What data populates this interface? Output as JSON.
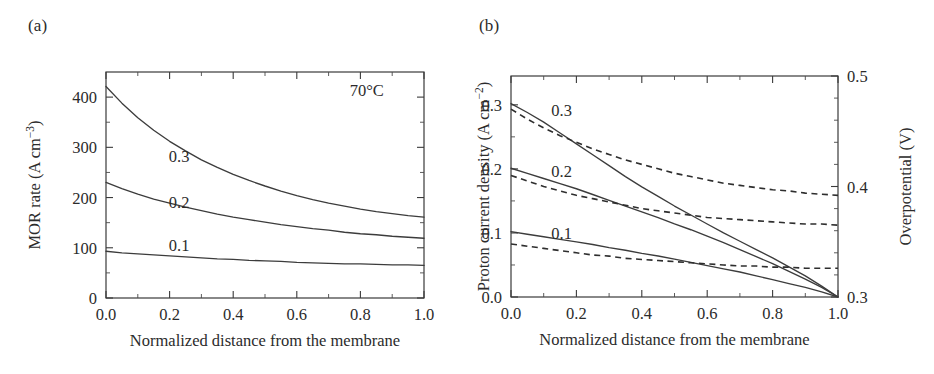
{
  "figure": {
    "panels": [
      {
        "tag": "(a)",
        "annotation": "70°C",
        "xlabel": "Normalized distance from the membrane",
        "ylabel_main": "MOR rate (A cm",
        "ylabel_sup": "−3",
        "ylabel_close": ")",
        "xticks": [
          "0.0",
          "0.2",
          "0.4",
          "0.6",
          "0.8",
          "1.0"
        ],
        "yticks": [
          "0",
          "100",
          "200",
          "300",
          "400"
        ],
        "curve_labels": [
          "0.3",
          "0.2",
          "0.1"
        ]
      },
      {
        "tag": "(b)",
        "xlabel": "Normalized distance from the membrane",
        "ylabel_main": "Proton current density (A cm",
        "ylabel_sup": "−2",
        "ylabel_close": ")",
        "ylabel_right": "Overpotential (V)",
        "xticks": [
          "0.0",
          "0.2",
          "0.4",
          "0.6",
          "0.8",
          "1.0"
        ],
        "yticks_left": [
          "0.0",
          "0.1",
          "0.2",
          "0.3"
        ],
        "yticks_right": [
          "0.3",
          "0.4",
          "0.5"
        ],
        "curve_labels": [
          "0.3",
          "0.2",
          "0.1"
        ]
      }
    ]
  },
  "chart_data": [
    {
      "type": "line",
      "panel": "(a)",
      "title": "",
      "xlabel": "Normalized distance from the membrane",
      "ylabel": "MOR rate (A cm−3)",
      "xlim": [
        0.0,
        1.0
      ],
      "ylim": [
        0,
        450
      ],
      "xticks": [
        0.0,
        0.2,
        0.4,
        0.6,
        0.8,
        1.0
      ],
      "yticks": [
        0,
        100,
        200,
        300,
        400
      ],
      "minor_ticks": true,
      "grid": false,
      "legend": "inline-curve-labels",
      "annotations": [
        {
          "text": "70°C",
          "x": 0.82,
          "y": 415
        }
      ],
      "x": [
        0.0,
        0.05,
        0.1,
        0.15,
        0.2,
        0.25,
        0.3,
        0.35,
        0.4,
        0.45,
        0.5,
        0.55,
        0.6,
        0.65,
        0.7,
        0.75,
        0.8,
        0.85,
        0.9,
        0.95,
        1.0
      ],
      "series": [
        {
          "name": "0.3",
          "style": "solid",
          "values": [
            421,
            388,
            359,
            334,
            312,
            293,
            275,
            260,
            246,
            234,
            223,
            213,
            204,
            196,
            189,
            183,
            177,
            172,
            168,
            164,
            161
          ]
        },
        {
          "name": "0.2",
          "style": "solid",
          "values": [
            230,
            218,
            207,
            197,
            189,
            181,
            174,
            167,
            161,
            156,
            151,
            146,
            142,
            138,
            135,
            131,
            128,
            126,
            123,
            121,
            119
          ]
        },
        {
          "name": "0.1",
          "style": "solid",
          "values": [
            93,
            90,
            88,
            86,
            84,
            82,
            80,
            78,
            77,
            75,
            74,
            73,
            71,
            70,
            69,
            68,
            68,
            67,
            66,
            66,
            65
          ]
        }
      ]
    },
    {
      "type": "line",
      "panel": "(b)",
      "title": "",
      "xlabel": "Normalized distance from the membrane",
      "ylabel_left": "Proton current density (A cm−2)",
      "ylabel_right": "Overpotential (V)",
      "xlim": [
        0.0,
        1.0
      ],
      "ylim_left": [
        0.0,
        0.345
      ],
      "ylim_right": [
        0.3,
        0.5
      ],
      "xticks": [
        0.0,
        0.2,
        0.4,
        0.6,
        0.8,
        1.0
      ],
      "yticks_left": [
        0.0,
        0.1,
        0.2,
        0.3
      ],
      "yticks_right": [
        0.3,
        0.4,
        0.5
      ],
      "minor_ticks": true,
      "grid": false,
      "legend": "inline-curve-labels",
      "series": [
        {
          "name": "0.3 proton current density",
          "axis": "left",
          "style": "solid",
          "x": [
            0.0,
            0.05,
            0.1,
            0.15,
            0.2,
            0.25,
            0.3,
            0.35,
            0.4,
            0.45,
            0.5,
            0.55,
            0.6,
            0.65,
            0.7,
            0.75,
            0.8,
            0.85,
            0.9,
            0.95,
            1.0
          ],
          "values": [
            0.302,
            0.288,
            0.273,
            0.256,
            0.239,
            0.222,
            0.205,
            0.188,
            0.172,
            0.157,
            0.142,
            0.128,
            0.114,
            0.1,
            0.087,
            0.074,
            0.061,
            0.047,
            0.033,
            0.017,
            0.0
          ]
        },
        {
          "name": "0.2 proton current density",
          "axis": "left",
          "style": "solid",
          "x": [
            0.0,
            0.05,
            0.1,
            0.15,
            0.2,
            0.25,
            0.3,
            0.35,
            0.4,
            0.45,
            0.5,
            0.55,
            0.6,
            0.65,
            0.7,
            0.75,
            0.8,
            0.85,
            0.9,
            0.95,
            1.0
          ],
          "values": [
            0.201,
            0.193,
            0.185,
            0.177,
            0.169,
            0.16,
            0.151,
            0.142,
            0.133,
            0.124,
            0.114,
            0.105,
            0.095,
            0.085,
            0.074,
            0.063,
            0.052,
            0.04,
            0.028,
            0.015,
            0.0
          ]
        },
        {
          "name": "0.1 proton current density",
          "axis": "left",
          "style": "solid",
          "x": [
            0.0,
            0.05,
            0.1,
            0.15,
            0.2,
            0.25,
            0.3,
            0.35,
            0.4,
            0.45,
            0.5,
            0.55,
            0.6,
            0.65,
            0.7,
            0.75,
            0.8,
            0.85,
            0.9,
            0.95,
            1.0
          ],
          "values": [
            0.102,
            0.098,
            0.094,
            0.09,
            0.086,
            0.082,
            0.077,
            0.073,
            0.068,
            0.064,
            0.059,
            0.054,
            0.049,
            0.044,
            0.039,
            0.033,
            0.027,
            0.021,
            0.015,
            0.008,
            0.0
          ]
        },
        {
          "name": "0.3 overpotential",
          "axis": "right",
          "style": "dashed",
          "x": [
            0.0,
            0.05,
            0.1,
            0.15,
            0.2,
            0.25,
            0.3,
            0.35,
            0.4,
            0.45,
            0.5,
            0.55,
            0.6,
            0.65,
            0.7,
            0.75,
            0.8,
            0.85,
            0.9,
            0.95,
            1.0
          ],
          "values": [
            0.47,
            0.461,
            0.453,
            0.446,
            0.44,
            0.434,
            0.429,
            0.424,
            0.42,
            0.416,
            0.412,
            0.409,
            0.406,
            0.403,
            0.401,
            0.399,
            0.397,
            0.396,
            0.394,
            0.393,
            0.392
          ]
        },
        {
          "name": "0.2 overpotential",
          "axis": "right",
          "style": "dashed",
          "x": [
            0.0,
            0.05,
            0.1,
            0.15,
            0.2,
            0.25,
            0.3,
            0.35,
            0.4,
            0.45,
            0.5,
            0.55,
            0.6,
            0.65,
            0.7,
            0.75,
            0.8,
            0.85,
            0.9,
            0.95,
            1.0
          ],
          "values": [
            0.41,
            0.405,
            0.4,
            0.396,
            0.392,
            0.389,
            0.386,
            0.383,
            0.38,
            0.378,
            0.376,
            0.374,
            0.372,
            0.371,
            0.37,
            0.369,
            0.368,
            0.367,
            0.366,
            0.366,
            0.365
          ]
        },
        {
          "name": "0.1 overpotential",
          "axis": "right",
          "style": "dashed",
          "x": [
            0.0,
            0.05,
            0.1,
            0.15,
            0.2,
            0.25,
            0.3,
            0.35,
            0.4,
            0.45,
            0.5,
            0.55,
            0.6,
            0.65,
            0.7,
            0.75,
            0.8,
            0.85,
            0.9,
            0.95,
            1.0
          ],
          "values": [
            0.348,
            0.346,
            0.344,
            0.342,
            0.34,
            0.338,
            0.337,
            0.335,
            0.334,
            0.333,
            0.332,
            0.331,
            0.33,
            0.329,
            0.328,
            0.328,
            0.327,
            0.327,
            0.326,
            0.326,
            0.326
          ]
        }
      ]
    }
  ]
}
